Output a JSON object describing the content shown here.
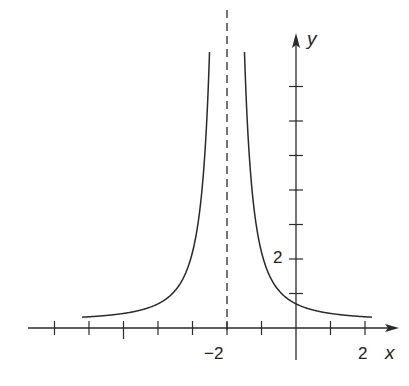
{
  "chart_data": {
    "type": "line",
    "title": "",
    "xlabel": "x",
    "ylabel": "y",
    "x_tick_labels": [
      "-2",
      "2"
    ],
    "y_tick_labels": [
      "2"
    ],
    "x_ticks": [
      -7,
      -6,
      -5,
      -4,
      -3,
      -2,
      -1,
      1,
      2
    ],
    "y_ticks": [
      1,
      2,
      3,
      4,
      5,
      6,
      7
    ],
    "vertical_asymptote": {
      "x": -2,
      "style": "dashed"
    },
    "horizontal_asymptote_approx": 0.2,
    "xlim": [
      -7.8,
      2.6
    ],
    "ylim": [
      -1.6,
      8.1
    ],
    "grid": false,
    "series": [
      {
        "name": "f(x)",
        "points": [
          {
            "x": -6,
            "y": 0.33
          },
          {
            "x": -5,
            "y": 0.42
          },
          {
            "x": -4,
            "y": 0.7
          },
          {
            "x": -3,
            "y": 2.2
          },
          {
            "x": -2.5,
            "y": 8.0
          },
          {
            "x": -1.5,
            "y": 8.0
          },
          {
            "x": -1,
            "y": 2.2
          },
          {
            "x": 0,
            "y": 0.7
          },
          {
            "x": 1,
            "y": 0.42
          },
          {
            "x": 2,
            "y": 0.33
          }
        ]
      }
    ]
  },
  "labels": {
    "x_axis": "x",
    "y_axis": "y",
    "x_neg2": "−2",
    "x_2": "2",
    "y_2": "2"
  },
  "colors": {
    "ink": "#2a2a2a",
    "background": "#ffffff"
  }
}
